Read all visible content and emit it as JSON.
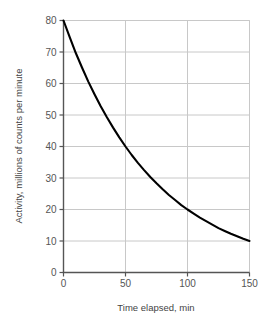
{
  "chart_data": {
    "type": "line",
    "title": "",
    "xlabel": "Time elapsed, min",
    "ylabel": "Activity, millions of counts per minute",
    "xlim": [
      0,
      150
    ],
    "ylim": [
      0,
      80
    ],
    "xticks": [
      0,
      50,
      100,
      150
    ],
    "yticks": [
      0,
      10,
      20,
      30,
      40,
      50,
      60,
      70,
      80
    ],
    "xtick_labels": [
      "0",
      "50",
      "100",
      "150"
    ],
    "ytick_labels": [
      "0",
      "10",
      "20",
      "30",
      "40",
      "50",
      "60",
      "70",
      "80"
    ],
    "grid": true,
    "legend": null,
    "series": [
      {
        "name": "Activity decay",
        "color": "#000000",
        "x": [
          0,
          5,
          10,
          15,
          20,
          25,
          30,
          35,
          40,
          45,
          50,
          55,
          60,
          65,
          70,
          75,
          80,
          85,
          90,
          95,
          100,
          105,
          110,
          115,
          120,
          125,
          130,
          135,
          140,
          145,
          150
        ],
        "y": [
          80.0,
          74.7,
          69.6,
          65.0,
          60.6,
          56.6,
          52.8,
          49.3,
          46.0,
          42.9,
          40.0,
          37.3,
          34.8,
          32.5,
          30.3,
          28.3,
          26.4,
          24.6,
          23.0,
          21.4,
          20.0,
          18.7,
          17.4,
          16.3,
          15.2,
          14.1,
          13.2,
          12.3,
          11.5,
          10.7,
          10.0
        ]
      }
    ],
    "annotations": []
  },
  "axes": {
    "y_title": "Activity, millions of counts per minute",
    "x_title": "Time elapsed, min"
  },
  "colors": {
    "curve": "#000000",
    "grid": "#c8c8c8",
    "axis": "#555555",
    "tick_text": "#555555",
    "background": "#ffffff"
  }
}
